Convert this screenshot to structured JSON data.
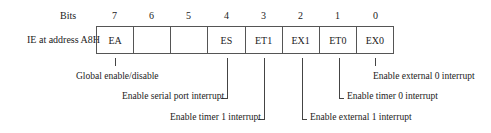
{
  "diagram": {
    "bits_label": "Bits",
    "register_label": "IE at address A8H",
    "bit_numbers": [
      "7",
      "6",
      "5",
      "4",
      "3",
      "2",
      "1",
      "0"
    ],
    "cells": [
      "EA",
      "",
      "",
      "ES",
      "ET1",
      "EX1",
      "ET0",
      "EX0"
    ],
    "annotations": {
      "ea": "Global enable/disable",
      "ex0": "Enable external 0 interrupt",
      "es": "Enable serial port interrupt",
      "et0": "Enable timer 0 interrupt",
      "et1": "Enable timer 1 interrupt",
      "ex1": "Enable external 1 interrupt"
    },
    "line_color": "#444444",
    "border_color": "#555555"
  }
}
